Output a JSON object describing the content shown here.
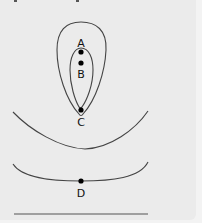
{
  "diagram": {
    "colors": {
      "background": "#ebebeb",
      "line": "#444444",
      "point": "#000000",
      "label": "#111111"
    },
    "points": [
      {
        "id": "A",
        "label": "A",
        "x": 81,
        "y": 52
      },
      {
        "id": "B",
        "label": "B",
        "x": 81,
        "y": 63
      },
      {
        "id": "C",
        "label": "C",
        "x": 81,
        "y": 110
      },
      {
        "id": "D",
        "label": "D",
        "x": 81,
        "y": 181
      }
    ],
    "curves": [
      {
        "name": "outer-loop",
        "type": "closed"
      },
      {
        "name": "inner-loop",
        "type": "closed"
      },
      {
        "name": "upper-arc",
        "type": "open"
      },
      {
        "name": "lower-arc",
        "type": "open"
      },
      {
        "name": "baseline",
        "type": "line"
      }
    ]
  }
}
